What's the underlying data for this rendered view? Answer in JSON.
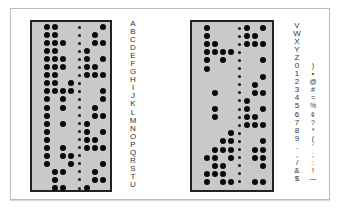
{
  "figure": {
    "left_tape": {
      "labels": [
        "A",
        "B",
        "C",
        "D",
        "E",
        "F",
        "G",
        "H",
        "I",
        "J",
        "K",
        "L",
        "M",
        "N",
        "O",
        "P",
        "Q",
        "R",
        "S",
        "T",
        "U"
      ],
      "rows": [
        [
          1,
          1,
          0,
          0,
          0,
          0,
          1
        ],
        [
          1,
          1,
          0,
          0,
          0,
          1,
          0
        ],
        [
          1,
          1,
          1,
          0,
          0,
          1,
          1
        ],
        [
          1,
          1,
          0,
          0,
          1,
          0,
          0
        ],
        [
          1,
          1,
          1,
          0,
          1,
          0,
          1
        ],
        [
          1,
          1,
          1,
          0,
          1,
          1,
          0
        ],
        [
          1,
          1,
          0,
          0,
          1,
          1,
          1
        ],
        [
          1,
          1,
          0,
          1,
          0,
          0,
          0
        ],
        [
          1,
          1,
          1,
          1,
          0,
          0,
          1
        ],
        [
          1,
          0,
          1,
          0,
          0,
          0,
          1
        ],
        [
          1,
          0,
          1,
          0,
          0,
          1,
          0
        ],
        [
          1,
          0,
          0,
          0,
          0,
          1,
          1
        ],
        [
          1,
          0,
          1,
          0,
          1,
          0,
          0
        ],
        [
          1,
          0,
          0,
          0,
          1,
          0,
          1
        ],
        [
          1,
          0,
          0,
          0,
          1,
          1,
          0
        ],
        [
          1,
          0,
          1,
          0,
          1,
          1,
          1
        ],
        [
          1,
          0,
          1,
          1,
          0,
          0,
          0
        ],
        [
          1,
          0,
          0,
          1,
          0,
          0,
          1
        ],
        [
          0,
          1,
          1,
          0,
          0,
          1,
          0
        ],
        [
          0,
          1,
          0,
          0,
          0,
          1,
          1
        ],
        [
          0,
          1,
          1,
          0,
          1,
          0,
          0
        ]
      ]
    },
    "right_tape": {
      "labels": [
        "V",
        "W",
        "X",
        "Y",
        "Z",
        "0",
        "1",
        "2",
        "3",
        "4",
        "5",
        "6",
        "7",
        "8",
        "9",
        ".",
        ",",
        "/",
        "&",
        "$"
      ],
      "symbols": [
        "",
        "",
        "",
        "",
        "",
        ")",
        "•",
        "@",
        "#",
        "=",
        "%",
        "¢",
        "?",
        "*",
        "(",
        "'",
        ";",
        ":",
        "!",
        "—"
      ],
      "rows": [
        [
          1,
          0,
          0,
          0,
          1,
          0,
          1
        ],
        [
          1,
          0,
          0,
          0,
          1,
          1,
          0
        ],
        [
          1,
          1,
          0,
          0,
          1,
          1,
          1
        ],
        [
          1,
          1,
          1,
          1,
          0,
          0,
          0
        ],
        [
          1,
          0,
          1,
          0,
          0,
          0,
          1
        ],
        [
          1,
          0,
          0,
          0,
          0,
          0,
          0
        ],
        [
          0,
          0,
          0,
          0,
          0,
          0,
          1
        ],
        [
          0,
          0,
          0,
          0,
          0,
          1,
          0
        ],
        [
          0,
          1,
          0,
          0,
          0,
          1,
          1
        ],
        [
          0,
          0,
          0,
          0,
          1,
          0,
          0
        ],
        [
          0,
          1,
          0,
          0,
          1,
          0,
          1
        ],
        [
          0,
          1,
          0,
          0,
          1,
          1,
          0
        ],
        [
          0,
          0,
          0,
          0,
          1,
          1,
          1
        ],
        [
          0,
          0,
          0,
          1,
          0,
          0,
          0
        ],
        [
          0,
          0,
          1,
          1,
          0,
          0,
          1
        ],
        [
          0,
          1,
          1,
          1,
          0,
          1,
          1
        ],
        [
          1,
          1,
          0,
          1,
          0,
          1,
          1
        ],
        [
          0,
          1,
          1,
          0,
          0,
          0,
          1
        ],
        [
          1,
          1,
          1,
          0,
          0,
          0,
          0
        ],
        [
          1,
          0,
          1,
          1,
          0,
          1,
          1
        ]
      ]
    }
  }
}
